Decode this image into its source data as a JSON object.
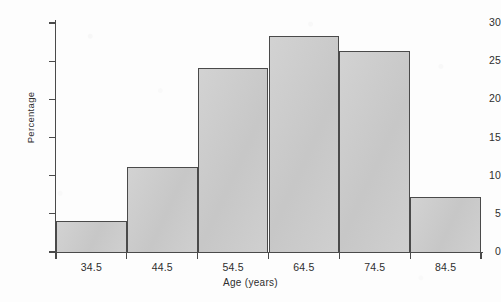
{
  "chart_data": {
    "type": "bar",
    "title": "",
    "subtitle": "",
    "xlabel": "Age (years)",
    "ylabel": "Percentage",
    "categories": [
      "34.5",
      "44.5",
      "54.5",
      "64.5",
      "74.5",
      "84.5"
    ],
    "values": [
      4.1,
      11.2,
      24.1,
      28.3,
      26.3,
      7.2
    ],
    "bin_edges": [
      "29.5",
      "39.5",
      "49.5",
      "59.5",
      "69.5",
      "79.5",
      "89.5"
    ],
    "ylim": [
      0,
      30
    ],
    "yticks": [
      0,
      5,
      10,
      15,
      20,
      25,
      30
    ],
    "ytick_labels": [
      "0",
      "5",
      "10",
      "15",
      "20",
      "25",
      "30"
    ],
    "xtick_labels": [
      "34.5",
      "44.5",
      "54.5",
      "64.5",
      "74.5",
      "84.5"
    ],
    "grid": false,
    "legend": false,
    "legend_position": "none",
    "bar_fill_color": "#cacaca",
    "bar_edge_color": "#4a4a4a",
    "axis_color": "#4a4a4a",
    "background_color": "#fdfdfd",
    "text_color": "#2e2e2e"
  }
}
